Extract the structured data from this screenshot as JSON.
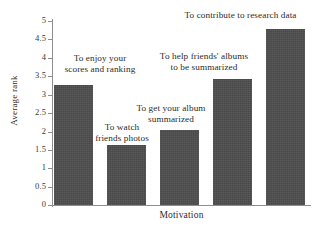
{
  "chart_data": {
    "type": "bar",
    "title": "",
    "xlabel": "Motivation",
    "ylabel": "Average rank",
    "categories": [
      "To enjoy your scores and ranking",
      "To watch friends photos",
      "To get your album summarized",
      "To help friends' albums to be summarized",
      "To contribute to research data"
    ],
    "values": [
      3.25,
      1.63,
      2.03,
      3.42,
      4.79
    ],
    "ylim": [
      0,
      5
    ],
    "yticks": [
      0,
      0.5,
      1,
      1.5,
      2,
      2.5,
      3,
      3.5,
      4,
      4.5,
      5
    ],
    "ytick_labels": [
      "0",
      "0.5",
      "1",
      "1.5",
      "2",
      "2.5",
      "3",
      "3.5",
      "4",
      "4.5",
      "5"
    ],
    "grid": false,
    "legend": "none",
    "bar_color": "#4d4d4d",
    "axis_color": "#8e8e8e"
  },
  "axes": {
    "y_title": "Average rank",
    "x_title": "Motivation",
    "ticks": [
      {
        "value": 5,
        "label": "5"
      },
      {
        "value": 4.5,
        "label": "4.5"
      },
      {
        "value": 4,
        "label": "4"
      },
      {
        "value": 3.5,
        "label": "3.5"
      },
      {
        "value": 3,
        "label": "3"
      },
      {
        "value": 2.5,
        "label": "2.5"
      },
      {
        "value": 2,
        "label": "2"
      },
      {
        "value": 1.5,
        "label": "1.5"
      },
      {
        "value": 1,
        "label": "1"
      },
      {
        "value": 0.5,
        "label": "0.5"
      },
      {
        "value": 0,
        "label": "0"
      }
    ]
  },
  "bars": [
    {
      "label_line1": "To enjoy your",
      "label_line2": "scores and ranking",
      "label": "To enjoy your\nscores and ranking",
      "value": 3.25
    },
    {
      "label_line1": "To watch",
      "label_line2": "friends photos",
      "label": "To watch\nfriends photos",
      "value": 1.63
    },
    {
      "label_line1": "To get your album",
      "label_line2": "summarized",
      "label": "To get your album\nsummarized",
      "value": 2.03
    },
    {
      "label_line1": "To help friends' albums",
      "label_line2": "to be summarized",
      "label": "To help friends' albums\nto be summarized",
      "value": 3.42
    },
    {
      "label_line1": "To contribute to research data",
      "label_line2": "",
      "label": "To contribute to research data",
      "value": 4.79
    }
  ]
}
